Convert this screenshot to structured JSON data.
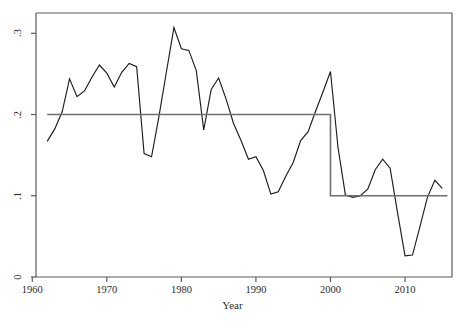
{
  "chart_data": {
    "type": "line",
    "title": "",
    "subtitle": "",
    "xlabel": "Year",
    "ylabel": "",
    "xlim": [
      1960.5,
      2016.3
    ],
    "ylim": [
      0,
      0.325
    ],
    "xticks": [
      1960,
      1970,
      1980,
      1990,
      2000,
      2010
    ],
    "xticklabels": [
      "1960",
      "1970",
      "1980",
      "1990",
      "2000",
      "2010"
    ],
    "yticks": [
      0,
      0.1,
      0.2,
      0.3
    ],
    "yticklabels": [
      "0",
      ".1",
      ".2",
      ".3"
    ],
    "grid": false,
    "legend": null,
    "legend_position": "none",
    "series": [
      {
        "name": "annual series",
        "kind": "line",
        "color": "#1c1c1c",
        "x": [
          1962,
          1963,
          1964,
          1965,
          1966,
          1967,
          1968,
          1969,
          1970,
          1971,
          1972,
          1973,
          1974,
          1975,
          1976,
          1977,
          1978,
          1979,
          1980,
          1981,
          1982,
          1983,
          1984,
          1985,
          1986,
          1987,
          1988,
          1989,
          1990,
          1991,
          1992,
          1993,
          1994,
          1995,
          1996,
          1997,
          1998,
          1999,
          2000,
          2001,
          2002,
          2003,
          2004,
          2005,
          2006,
          2007,
          2008,
          2009,
          2010,
          2011,
          2012,
          2013,
          2014,
          2015
        ],
        "values": [
          0.167,
          0.182,
          0.203,
          0.244,
          0.222,
          0.229,
          0.246,
          0.261,
          0.251,
          0.234,
          0.252,
          0.263,
          0.259,
          0.152,
          0.148,
          0.198,
          0.253,
          0.307,
          0.281,
          0.279,
          0.254,
          0.181,
          0.231,
          0.245,
          0.219,
          0.189,
          0.168,
          0.145,
          0.148,
          0.131,
          0.102,
          0.105,
          0.124,
          0.141,
          0.168,
          0.179,
          0.204,
          0.228,
          0.253,
          0.16,
          0.101,
          0.098,
          0.1,
          0.108,
          0.132,
          0.145,
          0.134,
          0.079,
          0.026,
          0.027,
          0.062,
          0.098,
          0.119,
          0.109
        ]
      },
      {
        "name": "step mean",
        "kind": "step",
        "color": "#6e6e6e",
        "x": [
          1962,
          2000,
          2000,
          2015.7
        ],
        "values": [
          0.2,
          0.2,
          0.1,
          0.1
        ],
        "breakpoint_year": 2000,
        "level_before": 0.2,
        "level_after": 0.1
      }
    ],
    "annotations": [],
    "axes_box": true,
    "background": "#ffffff"
  }
}
